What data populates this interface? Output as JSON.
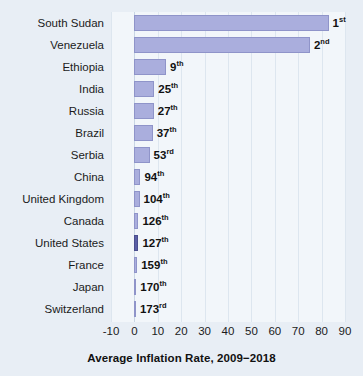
{
  "chart_data": {
    "type": "bar",
    "orientation": "horizontal",
    "title": "Average Inflation Rate, 2009−2018",
    "xlabel": "",
    "ylabel": "",
    "xlim": [
      -10,
      90
    ],
    "xticks": [
      -10,
      0,
      10,
      20,
      30,
      40,
      50,
      60,
      70,
      80,
      90
    ],
    "xtick_labels": [
      "-10",
      "0",
      "10",
      "20",
      "30",
      "40",
      "50",
      "60",
      "70",
      "80",
      "90"
    ],
    "grid": true,
    "legend": "none",
    "categories": [
      "South Sudan",
      "Venezuela",
      "Ethiopia",
      "India",
      "Russia",
      "Brazil",
      "Serbia",
      "China",
      "United Kingdom",
      "Canada",
      "United States",
      "France",
      "Japan",
      "Switzerland"
    ],
    "values": [
      83.0,
      75.0,
      13.5,
      8.5,
      8.3,
      7.8,
      6.5,
      2.6,
      2.2,
      1.7,
      1.7,
      1.2,
      0.8,
      0.3
    ],
    "rank_labels": [
      "1st",
      "2nd",
      "9th",
      "25th",
      "27th",
      "37th",
      "53rd",
      "94th",
      "104th",
      "126th",
      "127th",
      "159th",
      "170th",
      "173rd"
    ],
    "rank_numbers": [
      "1",
      "2",
      "9",
      "25",
      "27",
      "37",
      "53",
      "94",
      "104",
      "126",
      "127",
      "159",
      "170",
      "173"
    ],
    "rank_suffixes": [
      "st",
      "nd",
      "th",
      "th",
      "th",
      "th",
      "rd",
      "th",
      "th",
      "th",
      "th",
      "th",
      "th",
      "rd"
    ],
    "highlight_category": "United States",
    "colors": {
      "bar_fill": "#aaaedd",
      "bar_border": "#8f94c9",
      "highlight_fill": "#5b5fa6",
      "highlight_border": "#4a4e8e",
      "background": "#e8eef5",
      "plot_background": "#f2f6fa",
      "gridline": "#dde6ef",
      "text": "#1b1b1b"
    }
  }
}
